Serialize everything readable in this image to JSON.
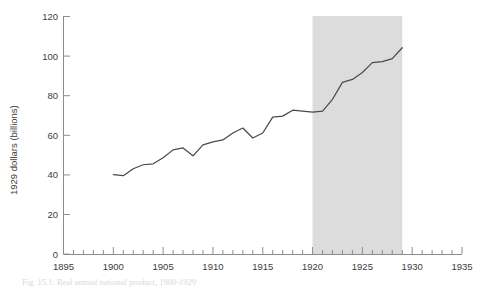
{
  "figure": {
    "background_color": "#ffffff",
    "line_color": "#4a4a4a",
    "axis_color": "#8c8c8c",
    "tick_label_color": "#3d3d3d",
    "shade_color": "#dcdcdc",
    "caption": "Fig. 15.1: Real annual national product, 1900-1929"
  },
  "chart_data": {
    "type": "line",
    "title": "",
    "subtitle": "",
    "xlabel": "",
    "ylabel": "1929 dollars (billions)",
    "xlim": [
      1895,
      1935
    ],
    "ylim": [
      0,
      120
    ],
    "xticks": [
      1895,
      1900,
      1905,
      1910,
      1915,
      1920,
      1925,
      1930,
      1935
    ],
    "xtick_labels": [
      "1895",
      "1900",
      "1905",
      "1910",
      "1915",
      "1920",
      "1925",
      "1930",
      "1935"
    ],
    "yticks": [
      0,
      20,
      40,
      60,
      80,
      100,
      120
    ],
    "ytick_labels": [
      "0",
      "20",
      "40",
      "60",
      "80",
      "100",
      "120"
    ],
    "minor_xtick_interval": 1,
    "grid": false,
    "legend": null,
    "legend_position": "none",
    "annotations": [
      {
        "kind": "shaded-band",
        "label": "1920-1929 highlighted period",
        "x_start": 1920,
        "x_end": 1929,
        "y_start": 0,
        "y_end": 120,
        "color": "#dcdcdc"
      }
    ],
    "series": [
      {
        "name": "Real national product",
        "x": [
          1900,
          1901,
          1902,
          1903,
          1904,
          1905,
          1906,
          1907,
          1908,
          1909,
          1910,
          1911,
          1912,
          1913,
          1914,
          1915,
          1916,
          1917,
          1918,
          1919,
          1920,
          1921,
          1922,
          1923,
          1924,
          1925,
          1926,
          1927,
          1928,
          1929
        ],
        "values": [
          40.0,
          39.5,
          43.0,
          45.0,
          45.5,
          48.5,
          52.5,
          53.5,
          49.5,
          55.0,
          56.5,
          57.5,
          61.0,
          63.5,
          58.5,
          61.0,
          69.0,
          69.5,
          72.5,
          72.0,
          71.5,
          72.0,
          78.0,
          86.5,
          88.0,
          91.5,
          96.5,
          97.0,
          98.5,
          104.0
        ]
      }
    ]
  }
}
